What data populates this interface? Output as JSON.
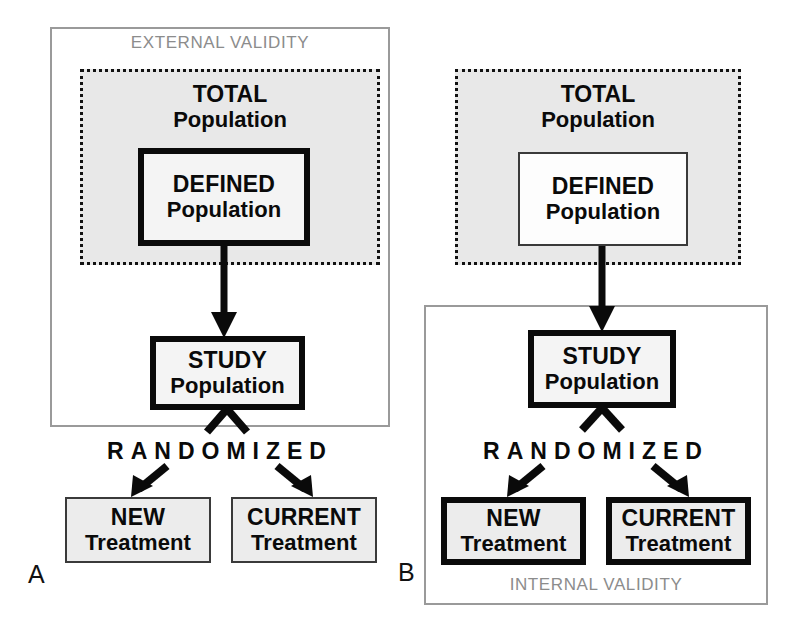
{
  "figure": {
    "panels": [
      {
        "letter": "A",
        "validity_label": "EXTERNAL VALIDITY",
        "validity_label_position": "top",
        "nodes": {
          "total": {
            "line1": "TOTAL",
            "line2": "Population"
          },
          "defined": {
            "line1": "DEFINED",
            "line2": "Population",
            "border": "thick"
          },
          "study": {
            "line1": "STUDY",
            "line2": "Population",
            "border": "thick"
          },
          "new_treatment": {
            "line1": "NEW",
            "line2": "Treatment",
            "border": "thin"
          },
          "current_treatment": {
            "line1": "CURRENT",
            "line2": "Treatment",
            "border": "thin"
          }
        },
        "randomized_label": "RANDOMIZED"
      },
      {
        "letter": "B",
        "validity_label": "INTERNAL VALIDITY",
        "validity_label_position": "bottom",
        "nodes": {
          "total": {
            "line1": "TOTAL",
            "line2": "Population"
          },
          "defined": {
            "line1": "DEFINED",
            "line2": "Population",
            "border": "thin"
          },
          "study": {
            "line1": "STUDY",
            "line2": "Population",
            "border": "thick"
          },
          "new_treatment": {
            "line1": "NEW",
            "line2": "Treatment",
            "border": "thick"
          },
          "current_treatment": {
            "line1": "CURRENT",
            "line2": "Treatment",
            "border": "thick"
          }
        },
        "randomized_label": "RANDOMIZED"
      }
    ]
  },
  "colors": {
    "validity_frame": "#9a9a9a",
    "validity_text": "#8c8c8c",
    "dotted_border": "#111111",
    "region_fill": "#e8e8e8",
    "node_fill": "#f4f4f4",
    "thick_border": "#0a0a0a",
    "thin_border": "#3a3a3a",
    "arrow": "#0a0a0a",
    "background": "#ffffff"
  }
}
